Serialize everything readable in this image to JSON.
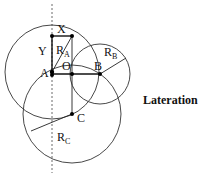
{
  "title": "Lateration",
  "labels": {
    "x": "X",
    "y": "Y",
    "a": "A",
    "o": "O",
    "b": "B",
    "c": "C",
    "ra_main": "R",
    "ra_sub": "A",
    "rb_main": "R",
    "rb_sub": "B",
    "rc_main": "R",
    "rc_sub": "C"
  },
  "colors": {
    "stroke": "#222222",
    "background": "#ffffff"
  }
}
